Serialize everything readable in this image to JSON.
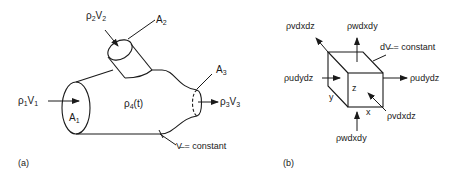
{
  "panel_a": {
    "caption": "(a)",
    "inlet1": {
      "label": "ρ",
      "sub": "1",
      "label2": "V",
      "sub2": "1"
    },
    "inlet2": {
      "label": "ρ",
      "sub": "2",
      "label2": "V",
      "sub2": "2"
    },
    "outlet3": {
      "label": "ρ",
      "sub": "3",
      "label2": "V",
      "sub2": "3"
    },
    "area1": {
      "label": "A",
      "sub": "1"
    },
    "area2": {
      "label": "A",
      "sub": "2"
    },
    "area3": {
      "label": "A",
      "sub": "3"
    },
    "interior": {
      "label": "ρ",
      "sub": "4",
      "suffix": "(t)"
    },
    "volume_note": "V̶ = constant"
  },
  "panel_b": {
    "caption": "(b)",
    "top_flux": "ρwdxdy",
    "bottom_flux": "ρwdxdy",
    "left_flux": "ρudydz",
    "right_flux": "ρudydz",
    "back_flux": "ρvdxdz",
    "front_flux": "ρvdxdz",
    "volume_note": "dV̶ = constant",
    "axis_x": "x",
    "axis_y": "y",
    "axis_z": "z"
  }
}
